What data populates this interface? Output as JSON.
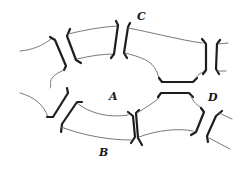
{
  "figure": {
    "labels": {
      "A": "A",
      "B": "B",
      "C": "C",
      "D": "D"
    },
    "colors": {
      "wall": "#1e1e1e",
      "membrane": "#6a6a6a",
      "background": "#ffffff"
    }
  }
}
